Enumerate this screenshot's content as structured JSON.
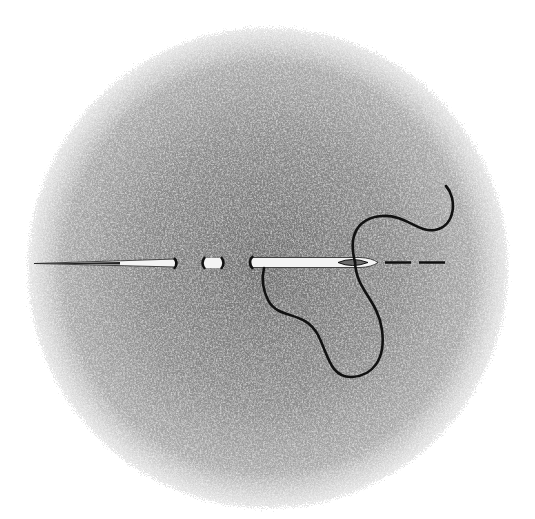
{
  "illustration": {
    "subject": "needle and thread",
    "background": {
      "shape": "stippled-circle",
      "center": [
        268,
        268
      ],
      "radius": 240,
      "color_center": "#7a7a7a",
      "color_edge": "#bdbdbd",
      "page_color": "#ffffff"
    },
    "needle": {
      "color_fill": "#f4f4f4",
      "color_outline": "#111111",
      "segments": 3,
      "break_marks": "dashed interruption indicating length",
      "eye_color": "#555555"
    },
    "thread": {
      "color": "#111111",
      "dashed_extension": true
    }
  }
}
